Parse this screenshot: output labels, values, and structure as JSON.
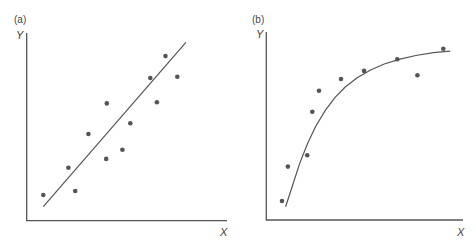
{
  "chart_data": [
    {
      "type": "scatter",
      "panel_label": "(a)",
      "title": "",
      "xlabel": "X",
      "ylabel": "Y",
      "xlim": [
        0,
        10
      ],
      "ylim": [
        0,
        10
      ],
      "grid": false,
      "ticks": false,
      "points": [
        {
          "x": 0.83,
          "y": 1.37
        },
        {
          "x": 2.08,
          "y": 2.82
        },
        {
          "x": 2.42,
          "y": 1.58
        },
        {
          "x": 3.08,
          "y": 4.62
        },
        {
          "x": 3.97,
          "y": 3.29
        },
        {
          "x": 4.0,
          "y": 6.25
        },
        {
          "x": 4.78,
          "y": 3.78
        },
        {
          "x": 5.17,
          "y": 5.19
        },
        {
          "x": 6.17,
          "y": 7.6
        },
        {
          "x": 6.5,
          "y": 6.31
        },
        {
          "x": 6.93,
          "y": 8.77
        },
        {
          "x": 7.52,
          "y": 7.67
        }
      ],
      "fit": {
        "kind": "linear",
        "x": [
          0.83,
          7.95
        ],
        "y": [
          0.75,
          9.5
        ]
      }
    },
    {
      "type": "scatter",
      "panel_label": "(b)",
      "title": "",
      "xlabel": "X",
      "ylabel": "Y",
      "xlim": [
        0,
        10
      ],
      "ylim": [
        0,
        10
      ],
      "grid": false,
      "ticks": false,
      "points": [
        {
          "x": 0.8,
          "y": 1.01
        },
        {
          "x": 1.1,
          "y": 2.84
        },
        {
          "x": 2.08,
          "y": 3.44
        },
        {
          "x": 2.34,
          "y": 5.76
        },
        {
          "x": 2.68,
          "y": 6.88
        },
        {
          "x": 3.8,
          "y": 7.5
        },
        {
          "x": 4.97,
          "y": 7.93
        },
        {
          "x": 6.66,
          "y": 8.55
        },
        {
          "x": 7.68,
          "y": 7.7
        },
        {
          "x": 9.0,
          "y": 9.11
        }
      ],
      "fit": {
        "kind": "saturating-curve",
        "x": [
          0.98,
          1.3,
          1.7,
          2.1,
          2.5,
          3.0,
          3.5,
          4.0,
          4.6,
          5.3,
          6.0,
          6.8,
          7.6,
          8.5,
          9.35
        ],
        "y": [
          0.71,
          1.73,
          3.01,
          4.07,
          4.96,
          5.83,
          6.52,
          7.06,
          7.55,
          7.98,
          8.3,
          8.56,
          8.75,
          8.9,
          8.98
        ]
      }
    }
  ]
}
